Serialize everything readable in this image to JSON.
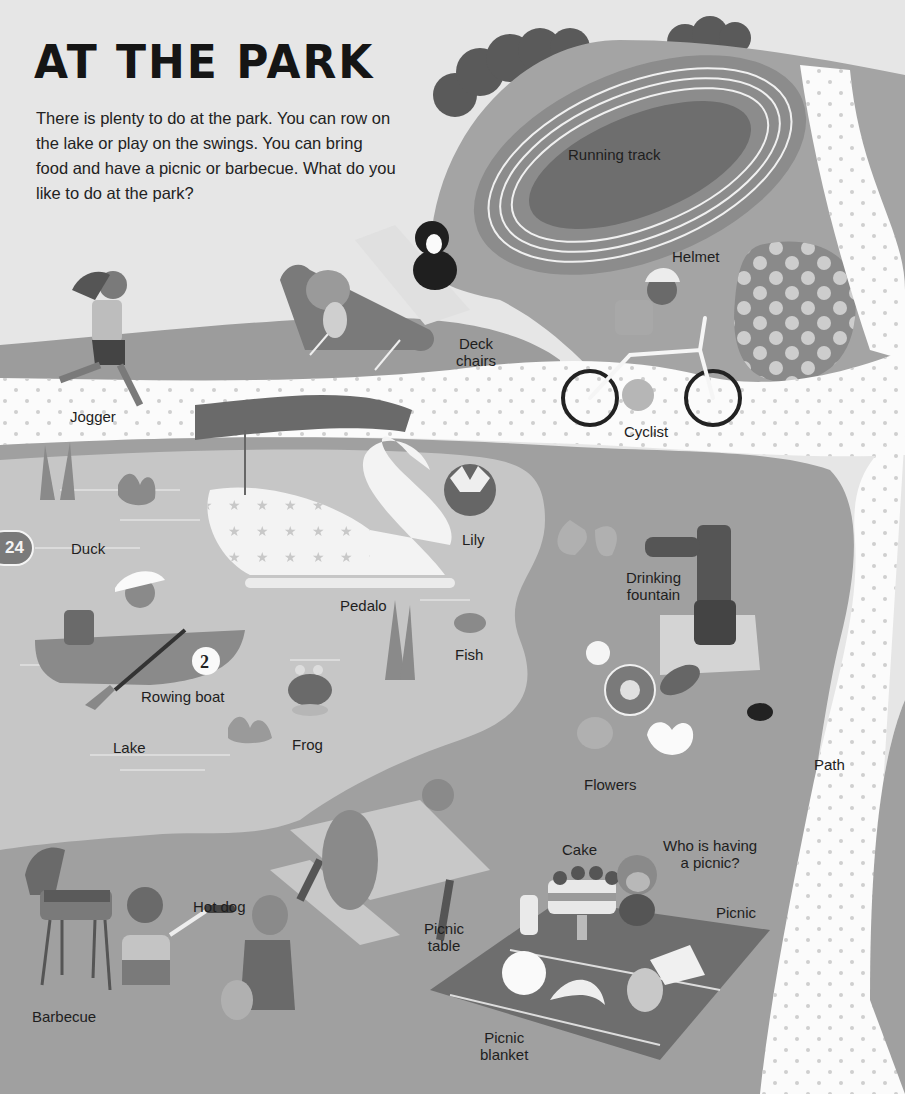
{
  "page": {
    "title": "AT THE PARK",
    "intro": "There is plenty to do at the park. You can row on the lake or play on the swings. You can bring food and have a picnic or barbecue. What do you like to do at the park?",
    "page_number": "24"
  },
  "labels": {
    "running_track": "Running track",
    "helmet": "Helmet",
    "deck_chairs": "Deck\nchairs",
    "jogger": "Jogger",
    "cyclist": "Cyclist",
    "duck": "Duck",
    "lily": "Lily",
    "pedalo": "Pedalo",
    "drinking_fountain": "Drinking\nfountain",
    "fish": "Fish",
    "rowing_boat": "Rowing boat",
    "frog": "Frog",
    "lake": "Lake",
    "flowers": "Flowers",
    "path": "Path",
    "cake": "Cake",
    "who_is_having_a_picnic": "Who is having\na picnic?",
    "picnic": "Picnic",
    "hot_dog": "Hot dog",
    "picnic_table": "Picnic\ntable",
    "barbecue": "Barbecue",
    "picnic_blanket": "Picnic\nblanket"
  },
  "illustration": {
    "boat_number": "2",
    "palette": {
      "background": "#e6e6e6",
      "grass_dark": "#9a9a9a",
      "grass_mid": "#a8a8a8",
      "lake": "#c4c4c4",
      "path": "#fbfbfb",
      "track": "#8a8a8a",
      "infield": "#727272",
      "tree": "#5a5a5a"
    }
  }
}
